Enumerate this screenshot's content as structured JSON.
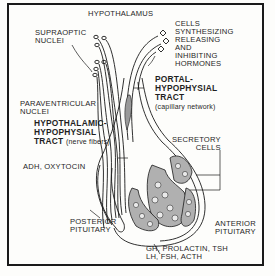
{
  "diagram": {
    "labels": {
      "hypothalamus": "HYPOTHALAMUS",
      "supraoptic": [
        "SUPRAOPTIC",
        "NUCLEI"
      ],
      "cells_synthesizing": [
        "CELLS",
        "SYNTHESIZING",
        "RELEASING",
        "AND",
        "INHIBITING",
        "HORMONES"
      ],
      "portal_tract": [
        "PORTAL-",
        "HYPOPHYSIAL",
        "TRACT"
      ],
      "portal_tract_note": "(capillary network)",
      "paraventricular": [
        "PARAVENTRICULAR",
        "NUCLEI"
      ],
      "hh_tract": [
        "HYPOTHALAMIC-",
        "HYPOPHYSIAL",
        "TRACT"
      ],
      "hh_tract_note": "(nerve fibers)",
      "secretory_cells": [
        "SECRETORY",
        "CELLS"
      ],
      "adh_oxytocin": "ADH, OXYTOCIN",
      "posterior_pituitary": [
        "POSTERIOR",
        "PITUITARY"
      ],
      "anterior_pituitary": [
        "ANTERIOR",
        "PITUITARY"
      ],
      "anterior_hormones": [
        "GH, PROLACTIN, TSH",
        "LH, FSH, ACTH"
      ]
    },
    "colors": {
      "ink": "#1a1a1a",
      "paper": "#fdfdfb",
      "shade": "#8a8a8a"
    }
  }
}
